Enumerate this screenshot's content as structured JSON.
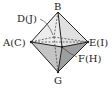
{
  "diagram": {
    "type": "octahedron",
    "labels": {
      "top": "B",
      "left": "A(C)",
      "back": "D(J)",
      "right": "E(I)",
      "front": "F(H)",
      "bottom": "G"
    },
    "colors": {
      "edge": "#222222",
      "upper_face": "#e6e6e6",
      "lower_left_face": "#bdbdbd",
      "lower_right_face": "#9a9a9a"
    }
  }
}
